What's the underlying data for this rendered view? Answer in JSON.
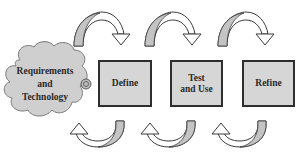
{
  "diagram": {
    "type": "iterative process cycle",
    "source_node": {
      "label_lines": [
        "Requirements",
        "and",
        "Technology"
      ],
      "shape": "cloud"
    },
    "stages": [
      {
        "id": "define",
        "label_lines": [
          "Define"
        ]
      },
      {
        "id": "test",
        "label_lines": [
          "Test",
          "and Use"
        ]
      },
      {
        "id": "refine",
        "label_lines": [
          "Refine"
        ]
      }
    ],
    "arrows": {
      "top": [
        "forward arc: requirements to define",
        "forward arc: define to test",
        "forward arc: test to refine"
      ],
      "bottom": [
        "return arc: define to requirements",
        "return arc: test to define",
        "return arc: refine to test"
      ]
    },
    "colors": {
      "box_fill": "#d6d6d6",
      "box_border": "#2e2e2e",
      "cloud_fill": "#cfcfcf",
      "arrow_fill": "#ffffff",
      "arrow_shade": "#c4c4c4",
      "stroke": "#3a3a3a"
    }
  }
}
